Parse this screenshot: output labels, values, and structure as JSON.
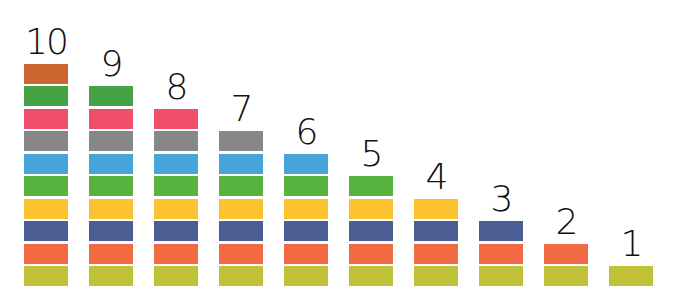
{
  "diagram": {
    "layout": {
      "bottom_y": 286,
      "block_height": 20,
      "block_gap": 2.5,
      "block_width": 44,
      "first_x": 24,
      "step_x": 65
    },
    "colors": {
      "olive": "#c2c23a",
      "orange": "#f26a43",
      "navy": "#4a5e93",
      "yellow": "#fbc32f",
      "green": "#58b23e",
      "blue": "#45a4d8",
      "gray": "#878787",
      "pink": "#ef4f6b",
      "green2": "#45a346",
      "brown": "#cc6530"
    },
    "stack_order_bottom_to_top": [
      "olive",
      "orange",
      "navy",
      "yellow",
      "green",
      "blue",
      "gray",
      "pink",
      "green2",
      "brown"
    ],
    "columns": [
      {
        "label": "10",
        "count": 10
      },
      {
        "label": "9",
        "count": 9
      },
      {
        "label": "8",
        "count": 8
      },
      {
        "label": "7",
        "count": 7
      },
      {
        "label": "6",
        "count": 6
      },
      {
        "label": "5",
        "count": 5
      },
      {
        "label": "4",
        "count": 4
      },
      {
        "label": "3",
        "count": 3
      },
      {
        "label": "2",
        "count": 2
      },
      {
        "label": "1",
        "count": 1
      }
    ]
  }
}
